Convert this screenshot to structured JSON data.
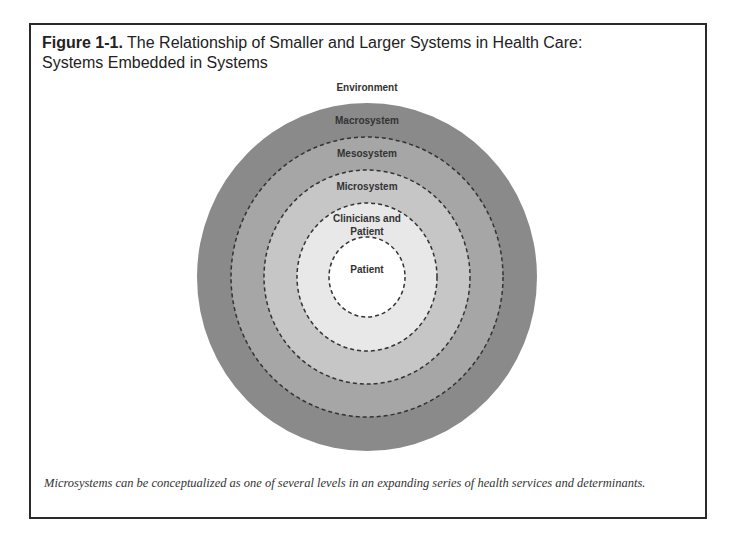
{
  "figure": {
    "label": "Figure 1-1.",
    "title_line1": " The Relationship of Smaller and Larger Systems in Health Care:",
    "title_line2": "Systems Embedded in Systems",
    "caption": "Microsystems can be conceptualized as one of several levels in an expanding series of health services and determinants."
  },
  "diagram": {
    "outer_label": "Environment",
    "rings": [
      {
        "name": "Macrosystem",
        "color": "#8a8a8a"
      },
      {
        "name": "Mesosystem",
        "color": "#a6a6a6"
      },
      {
        "name": "Microsystem",
        "color": "#c6c6c6"
      },
      {
        "name": "Clinicians and",
        "name_line2": "Patient",
        "color": "#e8e8e8"
      },
      {
        "name": "Patient",
        "color": "#ffffff"
      }
    ]
  }
}
